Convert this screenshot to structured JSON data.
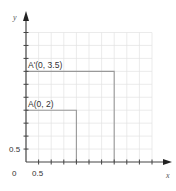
{
  "diagram": {
    "axes": {
      "x_label": "x",
      "y_label": "y",
      "origin_label": "0",
      "x_tick_label": "0.5",
      "y_tick_label": "0.5",
      "tick_step": 0.5,
      "x_max": 5,
      "y_max": 5
    },
    "points": [
      {
        "name": "A",
        "label": "A(0, 2)",
        "x": 0,
        "y": 2,
        "square_side": 2
      },
      {
        "name": "A'",
        "label": "A'(0, 3.5)",
        "x": 0,
        "y": 3.5,
        "square_side": 3.5
      }
    ],
    "colors": {
      "grid": "#e2e2e2",
      "axis": "#444444",
      "square_outline": "#999999",
      "text": "#333333"
    }
  }
}
